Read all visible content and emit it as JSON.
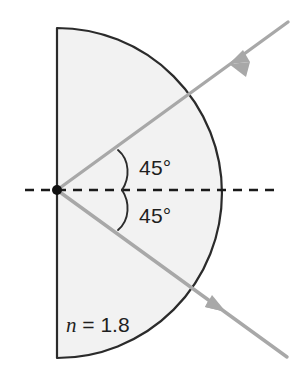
{
  "figure": {
    "background_color": "#ffffff",
    "width": 298,
    "height": 368
  },
  "medium": {
    "label_symbol": "n",
    "label_equals": " = ",
    "label_value": "1.8",
    "label_full": "n = 1.8",
    "fill_color": "#f2f2f2",
    "outline_color": "#2b2b2b"
  },
  "angles": {
    "incidence": "45°",
    "refraction": "45°"
  },
  "normal_axis": {
    "style": "dashed",
    "color": "#1a1a1a"
  },
  "rays": {
    "color": "#a8a8a8",
    "incoming_name": "incident-ray",
    "outgoing_name": "emergent-ray"
  },
  "vertex": {
    "color": "#111111"
  }
}
